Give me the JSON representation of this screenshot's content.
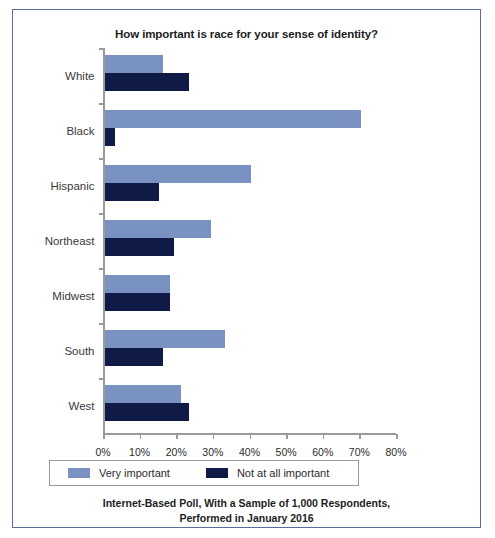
{
  "chart_data": {
    "type": "bar",
    "orientation": "horizontal",
    "title": "How important is race for your sense of identity?",
    "caption_line1": "Internet-Based Poll, With a Sample of 1,000 Respondents,",
    "caption_line2": "Performed in January 2016",
    "xlabel": "",
    "ylabel": "",
    "xlim": [
      0,
      80
    ],
    "xticks": [
      0,
      10,
      20,
      30,
      40,
      50,
      60,
      70,
      80
    ],
    "xticklabels": [
      "0%",
      "10%",
      "20%",
      "30%",
      "40%",
      "50%",
      "60%",
      "70%",
      "80%"
    ],
    "grid": false,
    "legend_position": "below-axes",
    "categories": [
      "White",
      "Black",
      "Hispanic",
      "Northeast",
      "Midwest",
      "South",
      "West"
    ],
    "series": [
      {
        "name": "Very important",
        "color": "#7a92c2",
        "values": [
          16,
          70,
          40,
          29,
          18,
          33,
          21
        ]
      },
      {
        "name": "Not at all important",
        "color": "#101a46",
        "values": [
          23,
          3,
          15,
          19,
          18,
          16,
          23
        ]
      }
    ]
  },
  "colors": {
    "light_blue": "#7a92c2",
    "dark_navy": "#101a46",
    "frame_border": "#5b6c9c",
    "axis_gray": "#9a9a9a"
  }
}
